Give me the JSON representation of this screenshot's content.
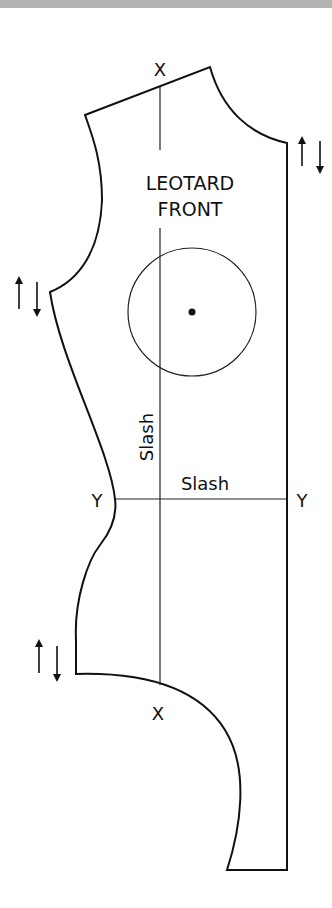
{
  "header_bar": {
    "color": "#b4b4b4"
  },
  "pattern": {
    "title_line1": "LEOTARD",
    "title_line2": "FRONT",
    "outline_color": "#111111",
    "markers": {
      "x_top": "X",
      "x_bottom": "X",
      "y_left": "Y",
      "y_right": "Y"
    },
    "slash_vertical_label": "Slash",
    "slash_horizontal_label": "Slash",
    "grainline_arrows": [
      {
        "position": "right-upper",
        "glyph": "↑↓"
      },
      {
        "position": "left-middle",
        "glyph": "↑↓"
      },
      {
        "position": "left-lower",
        "glyph": "↑↓"
      }
    ],
    "circle_marker": {
      "label": "bust-point-circle",
      "has_center_dot": true
    }
  }
}
